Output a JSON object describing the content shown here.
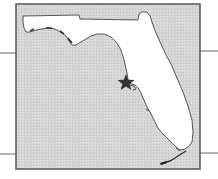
{
  "map": {
    "subject": "Florida state outline",
    "marker": {
      "icon": "star-icon",
      "location_label": "Tampa Bay area",
      "x": 126,
      "y": 82
    },
    "colors": {
      "water": "#d4d4d4",
      "land": "#ffffff",
      "frame": "#555555",
      "coast": "#444444",
      "marker": "#333333",
      "leader_lines": "#666666"
    }
  }
}
